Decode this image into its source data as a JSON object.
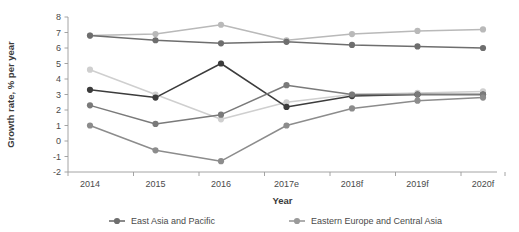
{
  "chart_data": {
    "type": "line",
    "title": "",
    "xlabel": "Year",
    "ylabel": "Growth rate, % per year",
    "categories": [
      "2014",
      "2015",
      "2016",
      "2017e",
      "2018f",
      "2019f",
      "2020f"
    ],
    "ylim": [
      -2,
      8
    ],
    "yticks": [
      "8",
      "7",
      "6",
      "5",
      "4",
      "3",
      "2",
      "1",
      "0",
      "-1",
      "-2"
    ],
    "grid": false,
    "legend_position": "bottom",
    "series": [
      {
        "name": "South Asia",
        "color": "#b9b9b9",
        "values": [
          6.8,
          6.9,
          7.5,
          6.5,
          6.9,
          7.1,
          7.2
        ]
      },
      {
        "name": "East Asia and Pacific",
        "color": "#6e6e6e",
        "values": [
          6.8,
          6.5,
          6.3,
          6.4,
          6.2,
          6.1,
          6.0
        ]
      },
      {
        "name": "Eastern Europe and Central Asia",
        "color": "#cfcfcf",
        "values": [
          4.6,
          3.0,
          1.4,
          2.5,
          3.0,
          3.1,
          3.2
        ]
      },
      {
        "name": "Middle East and North Africa",
        "color": "#3c3c3c",
        "values": [
          3.3,
          2.8,
          5.0,
          2.2,
          2.9,
          3.0,
          3.0
        ]
      },
      {
        "name": "Latin America and Caribbean",
        "color": "#7a7a7a",
        "values": [
          2.3,
          1.1,
          1.7,
          3.6,
          3.0,
          3.0,
          3.0
        ]
      },
      {
        "name": "Sub-Saharan Africa",
        "color": "#8c8c8c",
        "values": [
          1.0,
          -0.6,
          -1.3,
          1.0,
          2.1,
          2.6,
          2.8
        ]
      }
    ]
  },
  "legend": {
    "items": [
      {
        "label": "East Asia and Pacific",
        "color": "#6e6e6e"
      },
      {
        "label": "Eastern Europe and Central Asia",
        "color": "#9a9a9a"
      }
    ]
  }
}
